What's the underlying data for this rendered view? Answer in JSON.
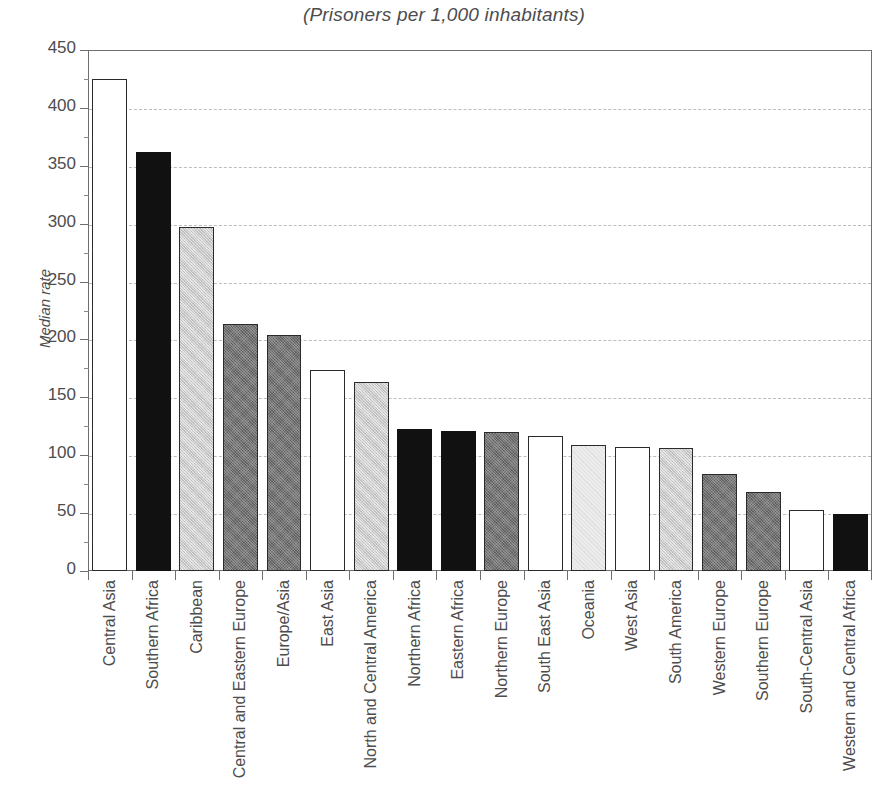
{
  "chart_data": {
    "type": "bar",
    "title": "(Prisoners per 1,000 inhabitants)",
    "xlabel": "",
    "ylabel": "Median rate",
    "ylim": [
      0,
      450
    ],
    "ytick_step": 50,
    "yticks": [
      "0",
      "50",
      "100",
      "150",
      "200",
      "250",
      "300",
      "350",
      "400",
      "450"
    ],
    "grid": "horizontal-dashed",
    "legend": "none",
    "categories": [
      "Central Asia",
      "Southern Africa",
      "Caribbean",
      "Central and Eastern Europe",
      "Europe/Asia",
      "East Asia",
      "North and Central America",
      "Northern Africa",
      "Eastern Africa",
      "Northern Europe",
      "South East Asia",
      "Oceania",
      "West Asia",
      "South America",
      "Western Europe",
      "Southern Europe",
      "South-Central Asia",
      "Western and Central Africa"
    ],
    "values": [
      425,
      362,
      297,
      213,
      204,
      174,
      163,
      123,
      121,
      120,
      117,
      109,
      107,
      106,
      84,
      68,
      53,
      49
    ],
    "bar_styles": [
      "white",
      "black",
      "lightgray",
      "darkgray",
      "darkgray",
      "white",
      "lightgray",
      "black",
      "black",
      "darkgray",
      "white",
      "verylight",
      "white",
      "lightgray",
      "darkgray",
      "darkgray",
      "white",
      "black"
    ]
  },
  "colors": {
    "axis": "#6e6e6e",
    "grid": "#bdbdbd",
    "text": "#4d4d4d",
    "bar_outline": "#2b2b2b",
    "fill_white": "#ffffff",
    "fill_black": "#111111",
    "fill_lightgray": "#c9c9c9",
    "fill_verylight": "#ececec",
    "fill_darkgray": "#757575"
  }
}
